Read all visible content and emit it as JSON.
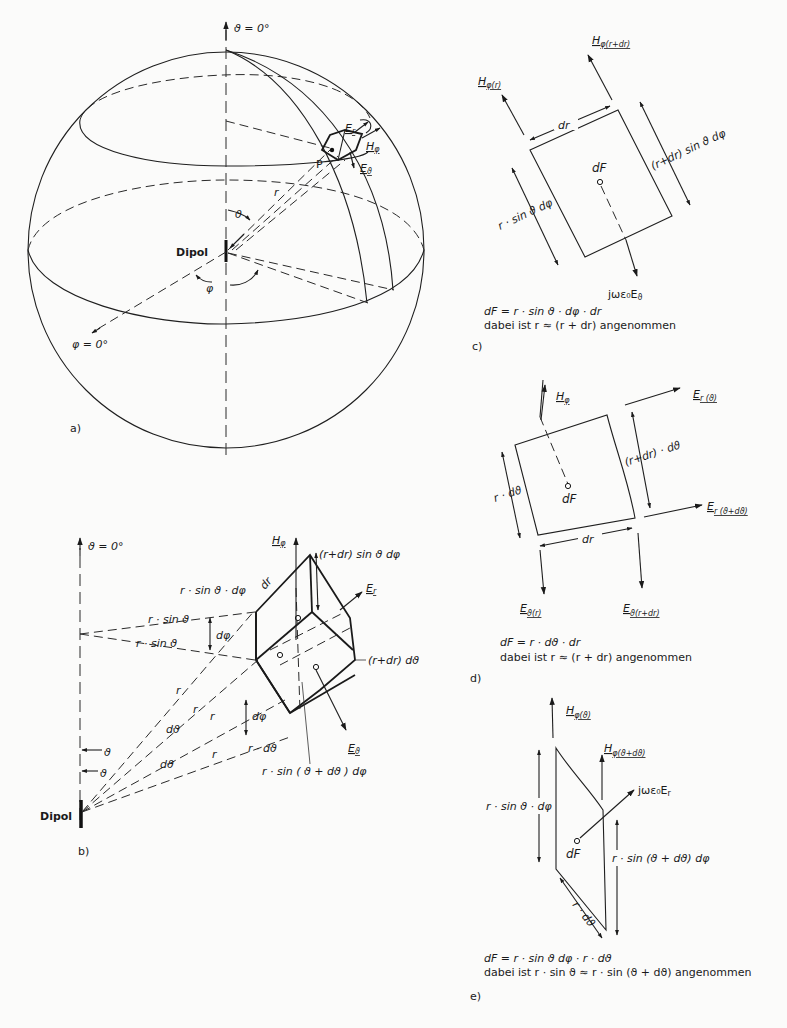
{
  "figure": {
    "panels": [
      {
        "id": "a",
        "label": "a)",
        "title": "Sphere around dipole",
        "labels": {
          "theta_axis": "ϑ = 0°",
          "phi_axis": "φ = 0°",
          "dipole": "Dipol",
          "point": "P",
          "radius": "r",
          "theta": "ϑ",
          "phi": "φ",
          "Er": "E",
          "Er_sub": "r",
          "Hphi": "H",
          "Hphi_sub": "φ",
          "Etheta": "E",
          "Etheta_sub": "ϑ"
        }
      },
      {
        "id": "b",
        "label": "b)",
        "title": "Volume element",
        "labels": {
          "theta_axis": "ϑ = 0°",
          "dipole": "Dipol",
          "Hphi": "H",
          "Hphi_sub": "φ",
          "top_edge": "(r+dr) sin ϑ dφ",
          "dr": "dr",
          "r_sin_dphi": "r · sin ϑ · dφ",
          "r_sin_1": "r · sin ϑ",
          "r_sin_2": "r · sin ϑ",
          "dphi_1": "dφ",
          "dphi_2": "dφ",
          "Er": "E",
          "Er_sub": "r",
          "rdr_dtheta": "(r+dr) dϑ",
          "r_labels": [
            "r",
            "r",
            "r",
            "r"
          ],
          "dtheta_1": "dϑ",
          "dtheta_2": "dϑ",
          "theta_1": "ϑ",
          "theta_2": "ϑ",
          "r_dtheta": "r · dϑ",
          "Etheta": "E",
          "Etheta_sub": "ϑ",
          "r_sin_theta_dtheta": "r · sin ( ϑ + dϑ ) dφ"
        }
      },
      {
        "id": "c",
        "label": "c)",
        "title": "Surface element dF (r–φ)",
        "labels": {
          "H_r": "H",
          "H_r_sub": "φ(r)",
          "H_rdr": "H",
          "H_rdr_sub": "φ(r+dr)",
          "dr": "dr",
          "right_edge": "(r+dr) sin ϑ dφ",
          "left_edge": "r · sin ϑ dφ",
          "dF": "dF",
          "current": "jωε₀E",
          "current_sub": "ϑ"
        },
        "caption": [
          "dF = r · sin ϑ · dφ · dr",
          "dabei ist r ≈ (r + dr) angenommen"
        ]
      },
      {
        "id": "d",
        "label": "d)",
        "title": "Surface element dF (r–ϑ)",
        "labels": {
          "Hphi": "H",
          "Hphi_sub": "φ",
          "Er_theta": "E",
          "Er_theta_sub": "r (ϑ)",
          "Er_theta_dtheta": "E",
          "Er_theta_dtheta_sub": "r (ϑ+dϑ)",
          "right_edge": "(r+dr) · dϑ",
          "left_edge": "r · dϑ",
          "dF": "dF",
          "dr": "dr",
          "Et_r": "E",
          "Et_r_sub": "ϑ(r)",
          "Et_rdr": "E",
          "Et_rdr_sub": "ϑ(r+dr)"
        },
        "caption": [
          "dF = r · dϑ · dr",
          "dabei ist r ≈ (r + dr) angenommen"
        ]
      },
      {
        "id": "e",
        "label": "e)",
        "title": "Surface element dF (ϑ–φ)",
        "labels": {
          "H_theta": "H",
          "H_theta_sub": "φ(ϑ)",
          "H_theta_dtheta": "H",
          "H_theta_dtheta_sub": "φ(ϑ+dϑ)",
          "current": "jωε₀E",
          "current_sub": "r",
          "left_edge": "r · sin ϑ · dφ",
          "right_edge": "r · sin (ϑ + dϑ) dφ",
          "bottom_edge": "r · dϑ",
          "dF": "dF"
        },
        "caption": [
          "dF = r · sin ϑ dφ · r · dϑ",
          "dabei ist r · sin ϑ ≈ r · sin (ϑ + dϑ) angenommen"
        ]
      }
    ]
  }
}
